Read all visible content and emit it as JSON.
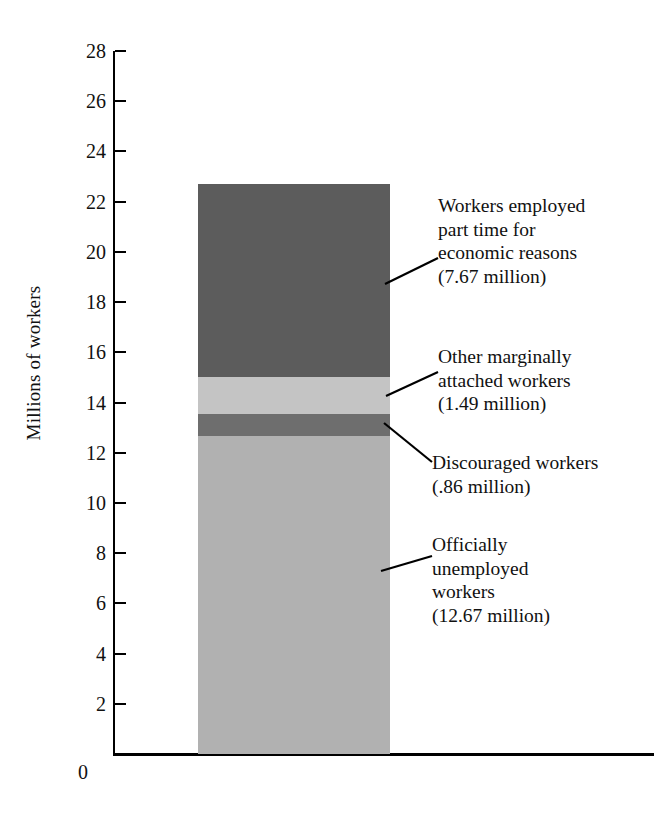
{
  "chart_data": {
    "type": "bar",
    "title": "",
    "subtitle": "",
    "xlabel": "",
    "ylabel": "Millions of workers",
    "ylim": [
      0,
      28
    ],
    "grid": false,
    "legend_position": "callout-labels-right",
    "stacked": true,
    "categories": [
      "Underutilized labor"
    ],
    "total": 22.69,
    "yticks": [
      28,
      26,
      24,
      22,
      20,
      18,
      16,
      14,
      12,
      10,
      8,
      6,
      4,
      2
    ],
    "ytick_labels": [
      "28",
      "26",
      "24",
      "22",
      "20",
      "18",
      "16",
      "14",
      "12",
      "10",
      "8",
      "6",
      "4",
      "2"
    ],
    "origin_label": "0",
    "series": [
      {
        "name": "Officially unemployed workers",
        "label": "Officially\nunemployed\nworkers\n(12.67 million)",
        "value": 12.67,
        "unit": "million",
        "color": "#b1b1b1",
        "order": 1
      },
      {
        "name": "Discouraged workers",
        "label": "Discouraged workers\n(.86 million)",
        "value": 0.86,
        "unit": "million",
        "color": "#6e6e6e",
        "order": 2
      },
      {
        "name": "Other marginally attached workers",
        "label": "Other marginally\nattached workers\n(1.49 million)",
        "value": 1.49,
        "unit": "million",
        "color": "#c4c4c4",
        "order": 3
      },
      {
        "name": "Workers employed part time for economic reasons",
        "label": "Workers employed\npart time for\neconomic reasons\n(7.67 million)",
        "value": 7.67,
        "unit": "million",
        "color": "#5c5c5c",
        "order": 4
      }
    ]
  },
  "axis": {
    "y_title": "Millions of workers",
    "zero": "0",
    "ticks": [
      "28",
      "26",
      "24",
      "22",
      "20",
      "18",
      "16",
      "14",
      "12",
      "10",
      "8",
      "6",
      "4",
      "2"
    ]
  },
  "callouts": {
    "part_time": "Workers employed\npart time for\neconomic reasons\n(7.67 million)",
    "marginally_attached": "Other marginally\nattached workers\n(1.49 million)",
    "discouraged": "Discouraged workers\n(.86 million)",
    "unemployed": "Officially\nunemployed\nworkers\n(12.67 million)"
  },
  "colors": {
    "part_time": "#5c5c5c",
    "marginally_attached": "#c4c4c4",
    "discouraged": "#6e6e6e",
    "unemployed": "#b1b1b1",
    "axis": "#000000",
    "background": "#ffffff",
    "text": "#111111"
  }
}
